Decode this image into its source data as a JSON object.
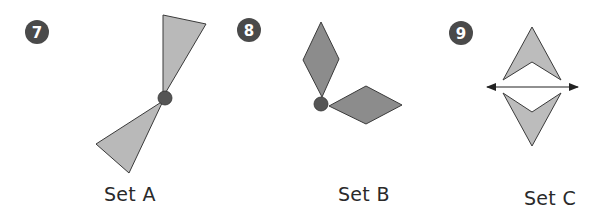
{
  "problems": [
    {
      "number": "7",
      "label": "Set A",
      "shape": "triangle",
      "description": "Two triangles joined at a rotation point"
    },
    {
      "number": "8",
      "label": "Set B",
      "shape": "rhombus",
      "description": "Two rhombuses joined at a rotation point"
    },
    {
      "number": "9",
      "label": "Set C",
      "shape": "arrowhead",
      "description": "Two arrowheads reflected across a line"
    }
  ],
  "colors": {
    "badge": "#4a4a4a",
    "triangle_fill": "#b9b9b9",
    "rhombus_fill": "#8c8c8c",
    "arrowhead_fill": "#bcbcbc",
    "outline": "#3a3a3a",
    "pivot": "#555555"
  },
  "icons": {
    "pivot": "center-of-rotation-dot",
    "line": "double-headed-arrow-line-of-reflection"
  }
}
